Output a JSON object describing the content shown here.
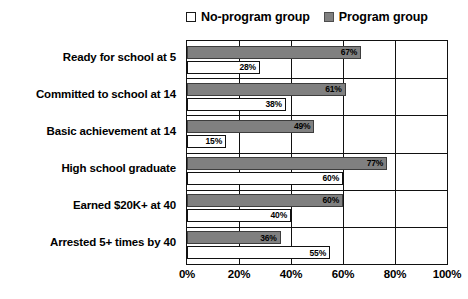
{
  "chart_data": {
    "type": "bar",
    "orientation": "horizontal",
    "title": "",
    "subtitle": "",
    "xlabel": "",
    "ylabel": "",
    "xlim": [
      0,
      100
    ],
    "xticks": [
      "0%",
      "20%",
      "40%",
      "60%",
      "80%",
      "100%"
    ],
    "xtick_values": [
      0,
      20,
      40,
      60,
      80,
      100
    ],
    "grid": true,
    "legend_position": "top-right",
    "categories": [
      "Ready for school at 5",
      "Committed to school at 14",
      "Basic achievement at 14",
      "High school graduate",
      "Earned $20K+ at 40",
      "Arrested 5+ times by 40"
    ],
    "series": [
      {
        "name": "Program group",
        "color": "#808080",
        "values": [
          67,
          61,
          49,
          77,
          60,
          36
        ],
        "labels": [
          "67%",
          "61%",
          "49%",
          "77%",
          "60%",
          "36%"
        ]
      },
      {
        "name": "No-program group",
        "color": "#ffffff",
        "values": [
          28,
          38,
          15,
          60,
          40,
          55
        ],
        "labels": [
          "28%",
          "38%",
          "15%",
          "60%",
          "40%",
          "55%"
        ]
      }
    ]
  },
  "legend": {
    "items": [
      {
        "label": "No-program group",
        "swatch": "noprog"
      },
      {
        "label": "Program group",
        "swatch": "prog"
      }
    ]
  }
}
